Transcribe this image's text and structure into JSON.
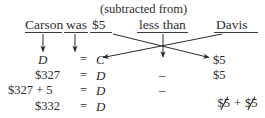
{
  "figure": {
    "kind": "algebra-translation-diagram",
    "ink_color": "#2b2b2b",
    "background_color": "#ffffff"
  },
  "annotation": {
    "subtracted_from": "(subtracted from)"
  },
  "sentence": {
    "parts": [
      {
        "text": "Carson",
        "maps_to": "C"
      },
      {
        "text": "was",
        "maps_to": "="
      },
      {
        "text": "$5",
        "maps_to": "$5"
      },
      {
        "text": "less than",
        "maps_to": "−"
      },
      {
        "text": "Davis",
        "maps_to": "D"
      }
    ]
  },
  "equations": [
    {
      "left": "C",
      "rel": "=",
      "right": "D",
      "op": "",
      "term": "$5"
    },
    {
      "left": "$327",
      "rel": "=",
      "right": "D",
      "op": "–",
      "term": "$5"
    },
    {
      "left": "$327 + 5",
      "rel": "=",
      "right": "D",
      "op": "–",
      "term_cancel_a": "$5",
      "term_plus": "+",
      "term_cancel_b": "$5"
    },
    {
      "left": "$332",
      "rel": "=",
      "right": "D",
      "op": "",
      "term": ""
    }
  ],
  "symbols": {
    "minus": "–",
    "plus": "+",
    "equals": "="
  }
}
